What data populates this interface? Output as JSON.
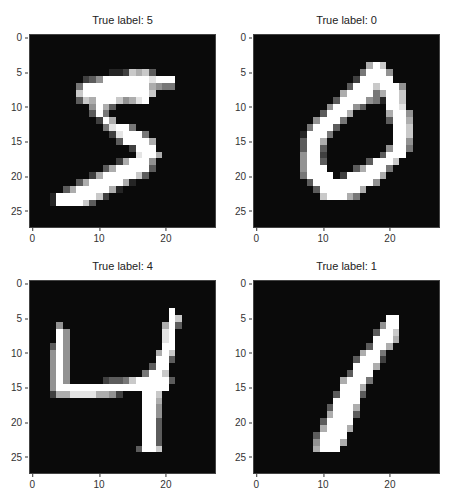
{
  "figure": {
    "layout": "2x2 grid of grayscale digit images",
    "colormap": "gray",
    "background": "#ffffff"
  },
  "chart_data": [
    {
      "type": "heatmap",
      "title": "True label: 5",
      "xticks": [
        "0",
        "10",
        "20"
      ],
      "yticks": [
        "0",
        "5",
        "10",
        "15",
        "20",
        "25"
      ],
      "xlim": [
        -0.5,
        27.5
      ],
      "ylim": [
        27.5,
        -0.5
      ],
      "grid": false,
      "pixels": [
        "0000000000000000000000000000",
        "0000000000000000000000000000",
        "0000000000000000000000000000",
        "0000000000000000000000000000",
        "0000000000000000000000000000",
        "0000000000001127673000000000",
        "0000000023599999998999000000",
        "0000000499999999996544000000",
        "0000000799999999997000000000",
        "0000000376999756890000000000",
        "0000000005963000000000000000",
        "0000000003940000000000000000",
        "0000000000296000000000000000",
        "0000000000048994000000000000",
        "0000000000002899940000000000",
        "0000000000000399996000000000",
        "0000000000000002999000000000",
        "0000000000000000899600000000",
        "0000000000000269995000000000",
        "0000000000036999993000000000",
        "0000000002699999730000000000",
        "0000000369999961000000000000",
        "0000036999996100000000000000",
        "0001999999720000000000000000",
        "0001999973000000000000000000",
        "0000000000000000000000000000",
        "0000000000000000000000000000",
        "0000000000000000000000000000"
      ]
    },
    {
      "type": "heatmap",
      "title": "True label: 0",
      "xticks": [
        "0",
        "10",
        "20"
      ],
      "yticks": [
        "0",
        "5",
        "10",
        "15",
        "20",
        "25"
      ],
      "xlim": [
        -0.5,
        27.5
      ],
      "ylim": [
        27.5,
        -0.5
      ],
      "grid": false,
      "pixels": [
        "0000000000000000000000000000",
        "0000000000000000000000000000",
        "0000000000000000000000000000",
        "0000000000000000000000000000",
        "0000000000000000069700000000",
        "0000000000000000499950000000",
        "0000000000000002999990000000",
        "0000000000000039997999500000",
        "0000000000000699994699700000",
        "0000000000003999954199700000",
        "0000000000059995300099800000",
        "0000000000399960000069950000",
        "0000000005999400000039960000",
        "0000000049993000000009970000",
        "0000000199940000000009970000",
        "0000000399600000000009950000",
        "0000000399300000000059940000",
        "0000000599200000000399900000",
        "0000000599300000039997000000",
        "0000000599900003699940000000",
        "0000000499990299999600000000",
        "0000000039999999995000000000",
        "0000000003999999600000000000",
        "0000000000799964000000000000",
        "0000000000000000000000000000",
        "0000000000000000000000000000",
        "0000000000000000000000000000",
        "0000000000000000000000000000"
      ]
    },
    {
      "type": "heatmap",
      "title": "True label: 4",
      "xticks": [
        "0",
        "10",
        "20"
      ],
      "yticks": [
        "0",
        "5",
        "10",
        "15",
        "20",
        "25"
      ],
      "xlim": [
        -0.5,
        27.5
      ],
      "ylim": [
        27.5,
        -0.5
      ],
      "grid": false,
      "pixels": [
        "0000000000000000000000000000",
        "0000000000000000000000000000",
        "0000000000000000000000000000",
        "0000000000000000000000000000",
        "0000000000000000000009000000",
        "0000000000000000000009700000",
        "0000500000000000000069300000",
        "0000950000000000000089000000",
        "0000950000000000000089000000",
        "0003950000000000000099000000",
        "0005950000000000000697000000",
        "0005950000000000000993000000",
        "0005950000000000003990000000",
        "0005950000000000049970000000",
        "0005950000023347999993000000",
        "0005999999999999999990000000",
        "0002668888665200099700000000",
        "0000000000000000099600000000",
        "0000000000000000099500000000",
        "0000000000000000099500000000",
        "0000000000000000099300000000",
        "0000000000000000099300000000",
        "0000000000000000099300000000",
        "0000000000000000099300000000",
        "0000000000000000399700000000",
        "0000000000000000000000000000",
        "0000000000000000000000000000",
        "0000000000000000000000000000"
      ]
    },
    {
      "type": "heatmap",
      "title": "True label: 1",
      "xticks": [
        "0",
        "10",
        "20"
      ],
      "yticks": [
        "0",
        "5",
        "10",
        "15",
        "20",
        "25"
      ],
      "xlim": [
        -0.5,
        27.5
      ],
      "ylim": [
        27.5,
        -0.5
      ],
      "grid": false,
      "pixels": [
        "0000000000000000000000000000",
        "0000000000000000000000000000",
        "0000000000000000000000000000",
        "0000000000000000000000000000",
        "0000000000000000000000000000",
        "0000000000000000000099000000",
        "0000000000000000000599000000",
        "0000000000000000003997000000",
        "0000000000000000009996000000",
        "0000000000000000039960000000",
        "0000000000000000699400000000",
        "0000000000000003999200000000",
        "0000000000000009996000000000",
        "0000000000000039990000000000",
        "0000000000000699940000000000",
        "0000000000000999600000000000",
        "0000000000003999300000000000",
        "0000000000009999000000000000",
        "0000000000039996000000000000",
        "0000000000069993000000000000",
        "0000000000399990000000000000",
        "0000000000699960000000000000",
        "0000000003999900000000000000",
        "0000000005999600000000000000",
        "0000000006999000000000000000",
        "0000000000000000000000000000",
        "0000000000000000000000000000",
        "0000000000000000000000000000"
      ]
    }
  ],
  "titles": [
    "True label: 5",
    "True label: 0",
    "True label: 4",
    "True label: 1"
  ],
  "ticks": {
    "x": [
      "0",
      "10",
      "20"
    ],
    "y": [
      "0",
      "5",
      "10",
      "15",
      "20",
      "25"
    ]
  }
}
